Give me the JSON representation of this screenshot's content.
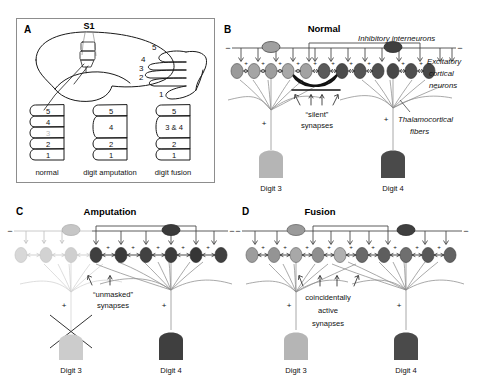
{
  "figure": {
    "caption_absent": true,
    "panels": [
      "A",
      "B",
      "C",
      "D"
    ]
  },
  "panelA": {
    "letter": "A",
    "brain_label": "S1",
    "hand_digits": [
      "1",
      "2",
      "3",
      "4",
      "5"
    ],
    "columns": [
      {
        "caption": "normal",
        "digits": [
          {
            "label": "5",
            "faded": false
          },
          {
            "label": "4",
            "faded": false
          },
          {
            "label": "3",
            "faded": true
          },
          {
            "label": "2",
            "faded": false
          },
          {
            "label": "1",
            "faded": false
          }
        ]
      },
      {
        "caption": "digit amputation",
        "digits": [
          {
            "label": "5",
            "faded": false
          },
          {
            "label": "4",
            "faded": false
          },
          {
            "label": "2",
            "faded": false
          },
          {
            "label": "1",
            "faded": false
          }
        ]
      },
      {
        "caption": "digit fusion",
        "digits": [
          {
            "label": "5",
            "faded": false
          },
          {
            "label": "3 & 4",
            "faded": false
          },
          {
            "label": "2",
            "faded": false
          },
          {
            "label": "1",
            "faded": false
          }
        ]
      }
    ]
  },
  "panelB": {
    "letter": "B",
    "title": "Normal",
    "labels": {
      "inhibitory": "Inhibitory interneurons",
      "excitatory_line1": "Excitatory",
      "excitatory_line2": "cortical",
      "excitatory_line3": "neurons",
      "silent_line1": "“silent”",
      "silent_line2": "synapses",
      "thalamo_line1": "Thalamocortical",
      "thalamo_line2": "fibers",
      "digit_left": "Digit 3",
      "digit_right": "Digit 4"
    },
    "neuron_shades": [
      "#9a9a9a",
      "#a5a5a5",
      "#9e9e9e",
      "#a8a8a8",
      "#a2a2a2",
      "#5a5a5a",
      "#4b4b4b",
      "#545454",
      "#4f4f4f",
      "#474747"
    ],
    "interneuron_shades": [
      "#a0a0a0",
      "#3f3f3f"
    ],
    "cone_left_color": "#b5b5b5",
    "cone_right_color": "#4a4a4a",
    "arrow_count": 12,
    "excitatory_signs": "+",
    "inhibitory_sign": "−"
  },
  "panelC": {
    "letter": "C",
    "title": "Amputation",
    "labels": {
      "unmasked_line1": "“unmasked”",
      "unmasked_line2": "synapses",
      "digit_left": "Digit 3",
      "digit_right": "Digit 4"
    },
    "neuron_shades": [
      "#d8d8d8",
      "#d2d2d2",
      "#cfcfcf",
      "#3f3f3f",
      "#3a3a3a",
      "#424242",
      "#3d3d3d",
      "#363636",
      "#404040",
      "#3b3b3b"
    ],
    "interneuron_shades": [
      "#c6c6c6",
      "#3a3a3a"
    ],
    "cone_left_color": "#cccccc",
    "cone_right_color": "#3f3f3f",
    "amputation_marker": "x-cross"
  },
  "panelD": {
    "letter": "D",
    "title": "Fusion",
    "labels": {
      "coincident_line1": "coincidentally",
      "coincident_line2": "active",
      "coincident_line3": "synapses",
      "digit_left": "Digit 3",
      "digit_right": "Digit 4"
    },
    "neuron_shades": [
      "#9d9d9d",
      "#949494",
      "#a8a8a8",
      "#8f8f8f",
      "#b0b0b0",
      "#6a6a6a",
      "#5e5e5e",
      "#6f6f6f",
      "#585858",
      "#626262"
    ],
    "interneuron_shades": [
      "#9a9a9a",
      "#3f3f3f"
    ],
    "cone_left_color": "#b5b5b5",
    "cone_right_color": "#4a4a4a"
  },
  "colors": {
    "ink": "#1a1a1a",
    "gray_line": "#9a9a9a",
    "faded": "#d2d2d2",
    "box_border": "#8d8d8d"
  }
}
